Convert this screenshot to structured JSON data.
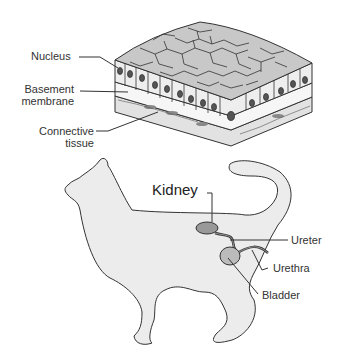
{
  "tissue_diagram": {
    "labels": {
      "nucleus": "Nucleus",
      "basement_line1": "Basement",
      "basement_line2": "membrane",
      "connective_line1": "Connective",
      "connective_line2": "tissue"
    }
  },
  "cat_diagram": {
    "labels": {
      "kidney": "Kidney",
      "ureter": "Ureter",
      "urethra": "Urethra",
      "bladder": "Bladder"
    }
  },
  "colors": {
    "cell_fill": "#c8c8c8",
    "cell_side": "#ececec",
    "nucleus": "#555555",
    "cat_fill": "#ececec",
    "organ": "#999999",
    "outline": "#333333"
  }
}
